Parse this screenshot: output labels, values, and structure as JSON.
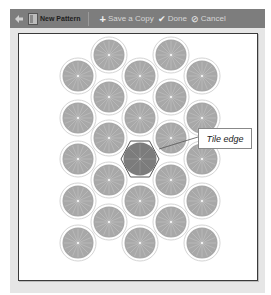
{
  "toolbar": {
    "back_icon": "arrow-left-icon",
    "pattern_icon": "pattern-icon",
    "pattern_name": "New Pattern",
    "save_copy_label": "Save a Copy",
    "done_label": "Done",
    "cancel_label": "Cancel"
  },
  "canvas": {
    "callout_label": "Tile edge",
    "tile_color": "#a5a5a5",
    "selected_tile_color": "#7f7f7f",
    "ring_color": "#d8d8d8"
  }
}
